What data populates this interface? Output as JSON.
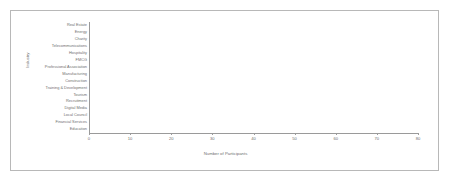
{
  "chart_data": {
    "type": "bar",
    "orientation": "horizontal",
    "title": "",
    "xlabel": "Number of Participants",
    "ylabel": "Industry",
    "xlim": [
      0,
      80
    ],
    "xticks": [
      0,
      10,
      20,
      30,
      40,
      50,
      60,
      70,
      80
    ],
    "grid": false,
    "legend": null,
    "bar_color": "#8c8c8c",
    "axis_color": "#9a9a9a",
    "text_color": "#6f6f6f",
    "background": "#ffffff",
    "frame_color": "#b8b8b8",
    "categories": [
      "Real Estate",
      "Energy",
      "Charity",
      "Telecommunications",
      "Hospitality",
      "FMCG",
      "Professional Association",
      "Manufacturing",
      "Construction",
      "Training & Development",
      "Tourism",
      "Recruitment",
      "Digital Media",
      "Local Council",
      "Financial Services",
      "Education"
    ],
    "values": [
      1,
      1,
      3,
      4,
      4,
      4,
      5,
      5,
      5,
      5,
      6,
      6,
      7,
      9,
      24,
      72
    ]
  }
}
